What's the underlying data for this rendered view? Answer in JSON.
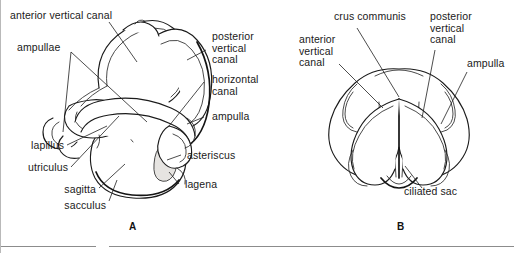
{
  "figure": {
    "panels": [
      {
        "id": "A",
        "letter": "A",
        "labels": [
          {
            "key": "anterior_vertical_canal",
            "text": "anterior vertical canal"
          },
          {
            "key": "ampullae",
            "text": "ampullae"
          },
          {
            "key": "posterior_vertical_canal",
            "text": "posterior\nvertical\ncanal"
          },
          {
            "key": "horizontal_canal",
            "text": "horizontal\ncanal"
          },
          {
            "key": "ampulla",
            "text": "ampulla"
          },
          {
            "key": "lapillus",
            "text": "lapillus"
          },
          {
            "key": "utriculus",
            "text": "utriculus"
          },
          {
            "key": "sagitta",
            "text": "sagitta"
          },
          {
            "key": "sacculus",
            "text": "sacculus"
          },
          {
            "key": "asteriscus",
            "text": "asteriscus"
          },
          {
            "key": "lagena",
            "text": "lagena"
          }
        ]
      },
      {
        "id": "B",
        "letter": "B",
        "labels": [
          {
            "key": "crus_communis",
            "text": "crus communis"
          },
          {
            "key": "posterior_vertical_canal",
            "text": "posterior\nvertical\ncanal"
          },
          {
            "key": "anterior_vertical_canal",
            "text": "anterior\nvertical\ncanal"
          },
          {
            "key": "ampulla",
            "text": "ampulla"
          },
          {
            "key": "ciliated_sac",
            "text": "ciliated sac"
          }
        ]
      }
    ],
    "colors": {
      "ink": "#1b1b1b",
      "leader": "#202020",
      "shade_light": "#f1f0ee",
      "shade_mid": "#e6e4e1",
      "rule": "#8c8c8c",
      "background": "#ffffff"
    }
  }
}
